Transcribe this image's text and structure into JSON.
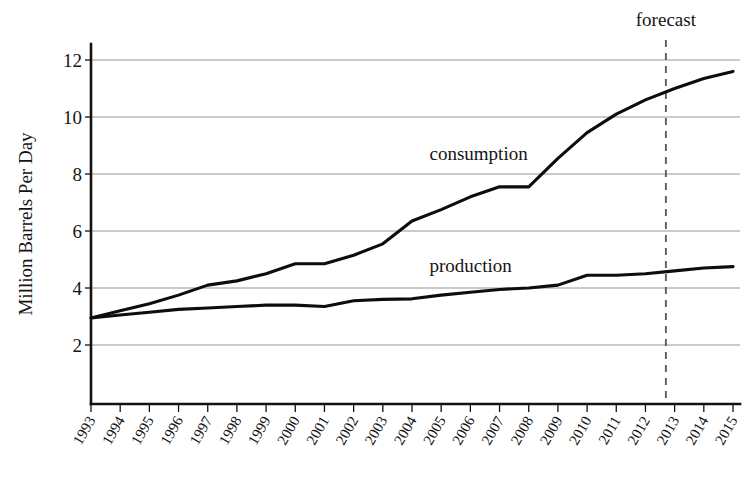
{
  "chart_data": {
    "type": "line",
    "title": "",
    "subtitle": "",
    "xlabel": "",
    "ylabel": "Million Barrels Per Day",
    "xlim": [
      1993,
      2015
    ],
    "ylim": [
      0,
      12.6
    ],
    "grid": true,
    "legend_position": "inline-annotation",
    "y_ticks": [
      2,
      4,
      6,
      8,
      10,
      12
    ],
    "x_ticks": [
      1993,
      1994,
      1995,
      1996,
      1997,
      1998,
      1999,
      2000,
      2001,
      2002,
      2003,
      2004,
      2005,
      2006,
      2007,
      2008,
      2009,
      2010,
      2011,
      2012,
      2013,
      2014,
      2015
    ],
    "x": [
      1993,
      1994,
      1995,
      1996,
      1997,
      1998,
      1999,
      2000,
      2001,
      2002,
      2003,
      2004,
      2005,
      2006,
      2007,
      2008,
      2009,
      2010,
      2011,
      2012,
      2013,
      2014,
      2015
    ],
    "series": [
      {
        "name": "consumption",
        "values": [
          2.95,
          3.2,
          3.45,
          3.75,
          4.1,
          4.25,
          4.5,
          4.85,
          4.85,
          5.15,
          5.55,
          6.35,
          6.75,
          7.2,
          7.55,
          7.55,
          8.55,
          9.45,
          10.1,
          10.6,
          11.0,
          11.35,
          11.6
        ]
      },
      {
        "name": "production",
        "values": [
          2.95,
          3.05,
          3.15,
          3.25,
          3.3,
          3.35,
          3.4,
          3.4,
          3.35,
          3.55,
          3.6,
          3.62,
          3.75,
          3.85,
          3.95,
          4.0,
          4.1,
          4.45,
          4.45,
          4.5,
          4.6,
          4.7,
          4.75
        ]
      }
    ],
    "annotations": [
      {
        "name": "consumption",
        "label": "consumption",
        "x": 2004.6,
        "y": 8.5
      },
      {
        "name": "production",
        "label": "production",
        "x": 2004.6,
        "y": 4.55
      },
      {
        "name": "forecast",
        "label": "forecast",
        "x": 2012.7,
        "y": 12.85
      }
    ],
    "forecast_marker": {
      "label": "forecast",
      "x": 2012.7,
      "style": "dashed-vertical",
      "color": "#5c5c5c"
    },
    "colors": {
      "line": "#0d0d0d",
      "grid": "#8a8a8a",
      "axis": "#121212",
      "forecast": "#5c5c5c",
      "background": "#ffffff",
      "text": "#141414"
    }
  }
}
